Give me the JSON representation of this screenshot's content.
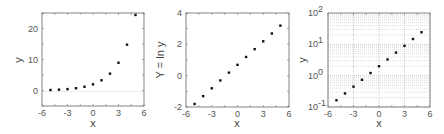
{
  "chart_data": [
    {
      "type": "scatter",
      "title": "",
      "xlabel": "x",
      "ylabel": "y",
      "xlim": [
        -6,
        6
      ],
      "ylim": [
        -5,
        25
      ],
      "xticks": [
        "-6",
        "-3",
        "0",
        "3",
        "6"
      ],
      "yticks": [
        "0",
        "10",
        "20"
      ],
      "grid": false,
      "x": [
        -5,
        -4,
        -3,
        -2,
        -1,
        0,
        1,
        2,
        3,
        4,
        5
      ],
      "y": [
        0.164,
        0.271,
        0.446,
        0.736,
        1.213,
        2.0,
        3.297,
        5.437,
        8.963,
        14.778,
        24.365
      ]
    },
    {
      "type": "scatter",
      "title": "",
      "xlabel": "x",
      "ylabel": "Y = ln y",
      "xlim": [
        -6,
        6
      ],
      "ylim": [
        -2,
        4
      ],
      "xticks": [
        "-6",
        "-3",
        "0",
        "3",
        "6"
      ],
      "yticks": [
        "-2",
        "0",
        "2",
        "4"
      ],
      "grid": false,
      "x": [
        -5,
        -4,
        -3,
        -2,
        -1,
        0,
        1,
        2,
        3,
        4,
        5
      ],
      "y": [
        -1.807,
        -1.307,
        -0.807,
        -0.307,
        0.193,
        0.693,
        1.193,
        1.693,
        2.193,
        2.693,
        3.193
      ]
    },
    {
      "type": "scatter",
      "title": "",
      "xlabel": "x",
      "ylabel": "y",
      "xlim": [
        -6,
        6
      ],
      "ylim": [
        0.1,
        100
      ],
      "yscale": "log",
      "xticks": [
        "-6",
        "-3",
        "0",
        "3",
        "6"
      ],
      "yticks": [
        "10^-1",
        "10^0",
        "10^1",
        "10^2"
      ],
      "grid": true,
      "x": [
        -5,
        -4,
        -3,
        -2,
        -1,
        0,
        1,
        2,
        3,
        4,
        5
      ],
      "y": [
        0.164,
        0.271,
        0.446,
        0.736,
        1.213,
        2.0,
        3.297,
        5.437,
        8.963,
        14.778,
        24.365
      ]
    }
  ],
  "labels": {
    "chart1": {
      "xlabel": "x",
      "ylabel": "y",
      "xticks": [
        "-6",
        "-3",
        "0",
        "3",
        "6"
      ],
      "yticks": [
        "0",
        "10",
        "20"
      ]
    },
    "chart2": {
      "xlabel": "x",
      "ylabel": "Y = ln y",
      "xticks": [
        "-6",
        "-3",
        "0",
        "3",
        "6"
      ],
      "yticks": [
        "-2",
        "0",
        "2",
        "4"
      ]
    },
    "chart3": {
      "xlabel": "x",
      "ylabel": "y",
      "xticks": [
        "-6",
        "-3",
        "0",
        "3",
        "6"
      ],
      "ytick_base": "10",
      "ytick_exps": [
        "-1",
        "0",
        "1",
        "2"
      ]
    }
  }
}
